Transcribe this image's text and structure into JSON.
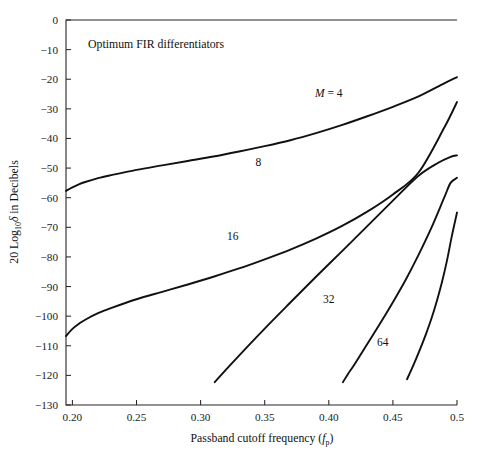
{
  "chart_data": {
    "type": "line",
    "title": "",
    "annotation_note": "Optimum FIR differentiators",
    "xlabel_prefix": "Passband cutoff frequency (",
    "xlabel_symbol": "f",
    "xlabel_symbol_sub": "p",
    "xlabel_suffix": ")",
    "ylabel_prefix": "20 Log",
    "ylabel_sub": "10",
    "ylabel_symbol": "δ",
    "ylabel_suffix": " in Decibels",
    "xlim": [
      0.195,
      0.5
    ],
    "ylim": [
      -130,
      0
    ],
    "grid": false,
    "legend_position": "inline-curve-labels",
    "xticks": [
      0.2,
      0.25,
      0.3,
      0.35,
      0.4,
      0.45,
      0.5
    ],
    "xtick_labels": [
      "0.20",
      "0.25",
      "0.30",
      "0.35",
      "0.40",
      "0.45",
      "0.5"
    ],
    "yticks": [
      0,
      -10,
      -20,
      -30,
      -40,
      -50,
      -60,
      -70,
      -80,
      -90,
      -100,
      -110,
      -120,
      -130
    ],
    "ytick_labels": [
      "0",
      "−10",
      "−20",
      "−30",
      "−40",
      "−50",
      "−60",
      "−70",
      "−80",
      "−90",
      "−100",
      "−110",
      "−120",
      "−130"
    ],
    "series": [
      {
        "name": "M = 4",
        "label_text": "M = 4",
        "label_has_italic_m": true,
        "label_x": 0.4,
        "label_y": -24.7,
        "x": [
          0.195,
          0.2,
          0.205,
          0.21,
          0.22,
          0.23,
          0.25,
          0.27,
          0.29,
          0.31,
          0.33,
          0.35,
          0.37,
          0.39,
          0.41,
          0.43,
          0.45,
          0.47,
          0.49,
          0.5
        ],
        "y": [
          -57.7,
          -56.5,
          -55.5,
          -54.7,
          -53.4,
          -52.4,
          -50.6,
          -49.1,
          -47.6,
          -46.1,
          -44.4,
          -42.6,
          -40.6,
          -38.2,
          -35.5,
          -32.5,
          -29.3,
          -25.8,
          -21.4,
          -19.3
        ]
      },
      {
        "name": "8",
        "label_text": "8",
        "label_has_italic_m": false,
        "label_x": 0.345,
        "label_y": -48.0,
        "x": [
          0.195,
          0.2,
          0.205,
          0.21,
          0.22,
          0.23,
          0.25,
          0.27,
          0.29,
          0.31,
          0.33,
          0.35,
          0.37,
          0.39,
          0.41,
          0.43,
          0.45,
          0.47,
          0.49,
          0.5
        ],
        "y": [
          -106.7,
          -104.3,
          -102.6,
          -101.2,
          -99.0,
          -97.3,
          -94.3,
          -91.8,
          -89.3,
          -86.7,
          -83.9,
          -80.8,
          -77.5,
          -73.8,
          -69.6,
          -64.7,
          -58.9,
          -51.5,
          -36.4,
          -27.7
        ]
      },
      {
        "name": "16",
        "label_text": "16",
        "label_has_italic_m": false,
        "label_x": 0.325,
        "label_y": -73.0,
        "x": [
          0.311,
          0.32,
          0.33,
          0.35,
          0.37,
          0.39,
          0.41,
          0.43,
          0.45,
          0.47,
          0.485,
          0.495,
          0.5
        ],
        "y": [
          -122.3,
          -118.0,
          -113.3,
          -104.2,
          -95.4,
          -86.7,
          -78.2,
          -69.6,
          -61.0,
          -52.6,
          -48.3,
          -46.2,
          -45.7
        ]
      },
      {
        "name": "32",
        "label_text": "32",
        "label_has_italic_m": false,
        "label_x": 0.4,
        "label_y": -94.3,
        "x": [
          0.411,
          0.415,
          0.42,
          0.43,
          0.44,
          0.45,
          0.46,
          0.47,
          0.48,
          0.49,
          0.495,
          0.5
        ],
        "y": [
          -122.3,
          -119.5,
          -116.3,
          -109.4,
          -102.5,
          -95.3,
          -87.7,
          -79.3,
          -70.2,
          -60.0,
          -55.0,
          -53.3
        ]
      },
      {
        "name": "64",
        "label_text": "64",
        "label_has_italic_m": false,
        "label_x": 0.442,
        "label_y": -108.8,
        "x": [
          0.461,
          0.464,
          0.468,
          0.472,
          0.476,
          0.48,
          0.484,
          0.488,
          0.492,
          0.496,
          0.5
        ],
        "y": [
          -121.3,
          -118.5,
          -114.5,
          -110.3,
          -105.8,
          -100.9,
          -95.3,
          -89.0,
          -81.6,
          -72.9,
          -65.0
        ]
      }
    ]
  }
}
